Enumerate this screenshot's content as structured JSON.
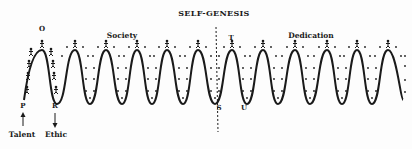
{
  "diagram": {
    "title": "SELF-GENESIS",
    "sections": [
      {
        "label": "Society",
        "x": 122,
        "y": 38
      },
      {
        "label": "Dedication",
        "x": 311,
        "y": 38
      }
    ],
    "point_labels": [
      {
        "label": "O",
        "x": 42,
        "y": 31
      },
      {
        "label": "P",
        "x": 23,
        "y": 108
      },
      {
        "label": "R",
        "x": 55,
        "y": 108
      },
      {
        "label": "T",
        "x": 231,
        "y": 40
      },
      {
        "label": "S",
        "x": 219,
        "y": 110
      },
      {
        "label": "U",
        "x": 244,
        "y": 110
      }
    ],
    "bottom_labels": [
      {
        "label": "Talent",
        "x": 22,
        "y": 137,
        "arrow": "up"
      },
      {
        "label": "Ethic",
        "x": 56,
        "y": 137,
        "arrow": "down"
      }
    ],
    "wave": {
      "start": [
        24,
        100
      ],
      "peaks_x": [
        42,
        75,
        106,
        137,
        167,
        198,
        232,
        263,
        295,
        327,
        357,
        388
      ],
      "troughs_x": [
        57,
        90,
        122,
        152,
        183,
        215,
        247,
        278,
        310,
        342,
        372
      ],
      "end": [
        403,
        100
      ],
      "peak_y": 50,
      "trough_y": 104
    },
    "divider": {
      "x1": 216,
      "y1": 27,
      "x2": 218,
      "y2": 132,
      "style": "dashed"
    },
    "figure_label": "stick figure climbers",
    "ink_color": "#1a1a1a"
  }
}
